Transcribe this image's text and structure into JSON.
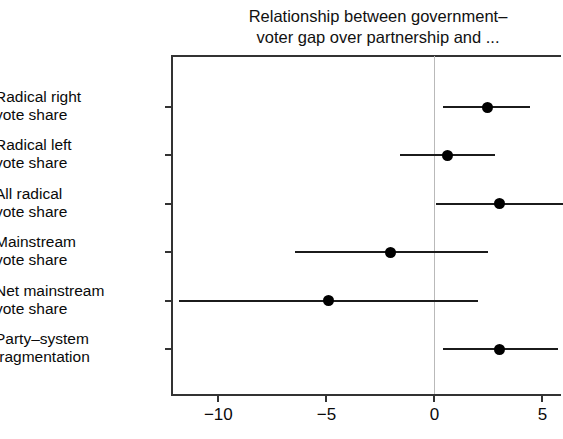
{
  "chart_data": {
    "type": "scatter",
    "subtype": "coefficient-plot-with-error-bars",
    "title": "Relationship between government–\nvoter gap over partnership and ...",
    "xlabel": "",
    "ylabel": "",
    "xlim": [
      -12.1,
      5.95
    ],
    "xticks": [
      -10,
      -5,
      0,
      5
    ],
    "xtick_labels": [
      "−10",
      "−5",
      "0",
      "5"
    ],
    "grid": false,
    "legend": null,
    "zero_reference_line": 0,
    "categories": [
      "Radical right\nvote share",
      "Radical left\nvote share",
      "All radical\nvote share",
      "Mainstream\nvote share",
      "Net mainstream\nvote share",
      "Party–system\nfragmentation"
    ],
    "estimates": [
      2.45,
      0.6,
      3.0,
      -2.05,
      -4.9,
      3.0
    ],
    "ci_low": [
      0.4,
      -1.6,
      0.05,
      -6.45,
      -11.8,
      0.4
    ],
    "ci_high": [
      4.4,
      2.8,
      5.95,
      2.5,
      2.0,
      5.7
    ],
    "points": [
      {
        "label": "Radical right vote share",
        "estimate": 2.45,
        "ci_low": 0.4,
        "ci_high": 4.4,
        "ci_clipped_right": true
      },
      {
        "label": "Radical left vote share",
        "estimate": 0.6,
        "ci_low": -1.6,
        "ci_high": 2.8,
        "ci_clipped_right": false
      },
      {
        "label": "All radical vote share",
        "estimate": 3.0,
        "ci_low": 0.05,
        "ci_high": 5.95,
        "ci_clipped_right": true
      },
      {
        "label": "Mainstream vote share",
        "estimate": -2.05,
        "ci_low": -6.45,
        "ci_high": 2.5,
        "ci_clipped_right": false
      },
      {
        "label": "Net mainstream vote share",
        "estimate": -4.9,
        "ci_low": -11.8,
        "ci_high": 2.0,
        "ci_clipped_right": false
      },
      {
        "label": "Party-system fragmentation",
        "estimate": 3.0,
        "ci_low": 0.4,
        "ci_high": 5.7,
        "ci_clipped_right": false
      }
    ],
    "colors": {
      "point": "#000000",
      "ci_bar": "#1b1b1b",
      "axis": "#333333",
      "zero_line": "#b9b9b9",
      "text": "#0a0a0a",
      "background": "#ffffff"
    }
  }
}
